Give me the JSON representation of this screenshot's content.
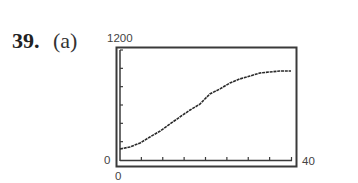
{
  "problem": {
    "number": "39.",
    "part": "(a)"
  },
  "window": {
    "ymax_label": "1200",
    "ymin_label": "0",
    "xmin_label": "0",
    "xmax_label": "40"
  },
  "colors": {
    "frame": "#3a3a3a",
    "curve": "#2a2a2a",
    "background": "#ffffff"
  },
  "chart_data": {
    "type": "line",
    "title": "",
    "xlabel": "",
    "ylabel": "",
    "xlim": [
      0,
      40
    ],
    "ylim": [
      0,
      1200
    ],
    "xticks_interval": 5,
    "yticks_interval": 200,
    "grid": false,
    "series": [
      {
        "name": "logistic curve",
        "x": [
          0,
          2.3,
          4.7,
          7.0,
          9.4,
          11.7,
          14.0,
          16.4,
          18.7,
          21.0,
          23.4,
          25.7,
          28.0,
          30.4,
          32.7,
          35.0,
          37.4,
          40.0
        ],
        "y": [
          120,
          142,
          185,
          251,
          316,
          393,
          469,
          545,
          610,
          720,
          776,
          840,
          884,
          916,
          949,
          960,
          971,
          971
        ]
      }
    ]
  }
}
